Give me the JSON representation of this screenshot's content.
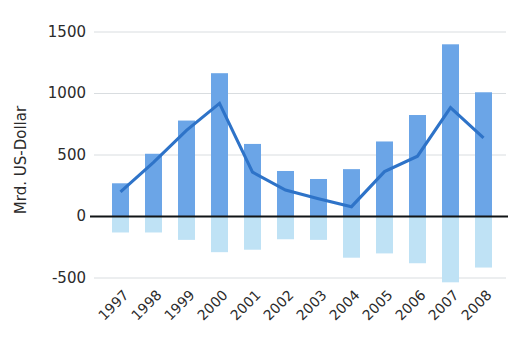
{
  "chart_data": {
    "type": "bar",
    "title": "",
    "subtitle": "",
    "xlabel": "",
    "ylabel": "Mrd. US-Dollar",
    "categories": [
      "1997",
      "1998",
      "1999",
      "2000",
      "2001",
      "2002",
      "2003",
      "2004",
      "2005",
      "2006",
      "2007",
      "2008"
    ],
    "ylim": [
      -500,
      1500
    ],
    "y_ticks": [
      1500,
      1000,
      500,
      0,
      -500
    ],
    "y_tick_labels": [
      "1500",
      "1000",
      "500",
      "0",
      "-500"
    ],
    "grid": true,
    "legend": "none",
    "series": [
      {
        "name": "bars",
        "kind": "bar",
        "color": "#6BA5E7",
        "values": [
          270,
          510,
          780,
          1165,
          590,
          370,
          305,
          385,
          610,
          825,
          1400,
          1010
        ]
      },
      {
        "name": "reflection",
        "kind": "bar",
        "color": "#BFE2F5",
        "values": [
          -130,
          -130,
          -190,
          -290,
          -270,
          -185,
          -190,
          -335,
          -300,
          -380,
          -535,
          -415
        ]
      },
      {
        "name": "line",
        "kind": "line",
        "color": "#2E73C8",
        "values": [
          200,
          440,
          700,
          920,
          360,
          215,
          145,
          80,
          365,
          490,
          885,
          640
        ]
      }
    ],
    "annotations": []
  },
  "axes": {
    "y_axis_title": "Mrd. US-Dollar",
    "zero_line_label": "0"
  },
  "colors": {
    "bar": "#6BA5E7",
    "bar_reflection": "#BFE2F5",
    "line": "#2E73C8",
    "gridline": "#d9dde0",
    "zero_axis": "#111416",
    "text": "#2b2b2b",
    "background": "#ffffff"
  }
}
